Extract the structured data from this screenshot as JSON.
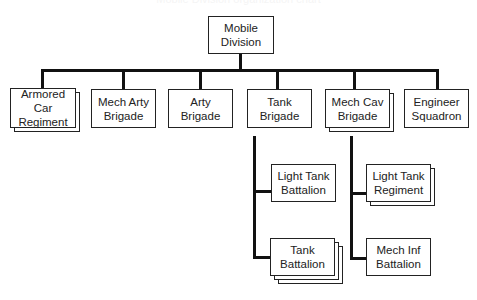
{
  "title": "Mobile Division organization chart",
  "colors": {
    "line": "#111111",
    "box_border": "#222222",
    "text": "#222222",
    "background": "#ffffff"
  },
  "root": {
    "label_line1": "Mobile",
    "label_line2": "Division"
  },
  "level1": [
    {
      "id": "armored-car-regiment",
      "label_line1": "Armored Car",
      "label_line2": "Regiment",
      "stacked": 2
    },
    {
      "id": "mech-arty-brigade",
      "label_line1": "Mech Arty",
      "label_line2": "Brigade",
      "stacked": 1
    },
    {
      "id": "arty-brigade",
      "label_line1": "Arty",
      "label_line2": "Brigade",
      "stacked": 1
    },
    {
      "id": "tank-brigade",
      "label_line1": "Tank",
      "label_line2": "Brigade",
      "stacked": 1
    },
    {
      "id": "mech-cav-brigade",
      "label_line1": "Mech Cav",
      "label_line2": "Brigade",
      "stacked": 2
    },
    {
      "id": "engineer-squadron",
      "label_line1": "Engineer",
      "label_line2": "Squadron",
      "stacked": 1
    }
  ],
  "tank_brigade_children": [
    {
      "id": "light-tank-battalion",
      "label_line1": "Light Tank",
      "label_line2": "Battalion",
      "stacked": 1
    },
    {
      "id": "tank-battalion",
      "label_line1": "Tank",
      "label_line2": "Battalion",
      "stacked": 3
    }
  ],
  "mech_cav_brigade_children": [
    {
      "id": "light-tank-regiment",
      "label_line1": "Light Tank",
      "label_line2": "Regiment",
      "stacked": 2
    },
    {
      "id": "mech-inf-battalion",
      "label_line1": "Mech Inf",
      "label_line2": "Battalion",
      "stacked": 1
    }
  ]
}
